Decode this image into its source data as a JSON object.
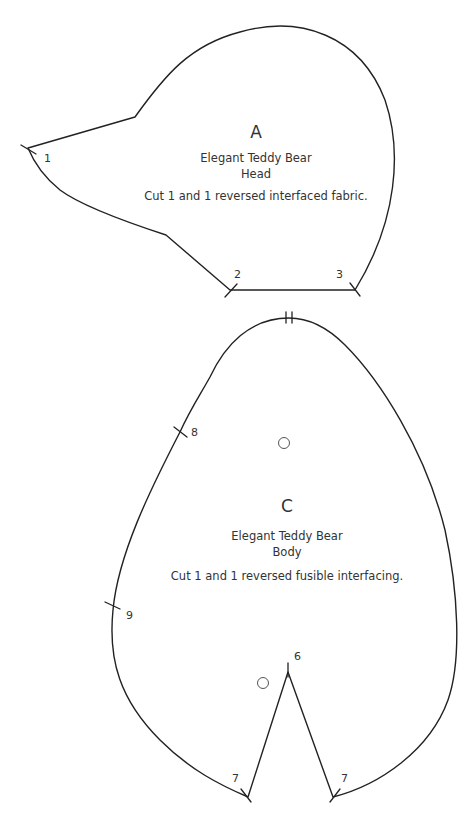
{
  "pieces": {
    "head": {
      "letter": "A",
      "title": "Elegant Teddy Bear",
      "name": "Head",
      "instructions": "Cut 1 and 1 reversed interfaced fabric.",
      "notches": [
        {
          "label": "1"
        },
        {
          "label": "2"
        },
        {
          "label": "3"
        }
      ]
    },
    "body": {
      "letter": "C",
      "title": "Elegant Teddy Bear",
      "name": "Body",
      "instructions": "Cut 1 and 1 reversed fusible interfacing.",
      "notches": [
        {
          "label": "8"
        },
        {
          "label": "9"
        },
        {
          "label": "6"
        },
        {
          "label": "7"
        },
        {
          "label": "7"
        }
      ]
    }
  },
  "colors": {
    "line": "#222222",
    "text": "#333333",
    "background": "#ffffff"
  }
}
